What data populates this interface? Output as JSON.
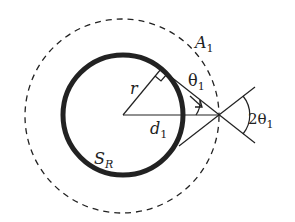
{
  "diagram": {
    "type": "geometry",
    "labels": {
      "outer_circle": "A",
      "outer_circle_sub": "1",
      "theta": "θ",
      "theta_sub": "1",
      "two_theta": "2θ",
      "two_theta_sub": "1",
      "radius": "r",
      "distance": "d",
      "distance_sub": "1",
      "sphere": "S",
      "sphere_sub": "R"
    },
    "colors": {
      "stroke": "#222222",
      "background": "#ffffff"
    }
  }
}
